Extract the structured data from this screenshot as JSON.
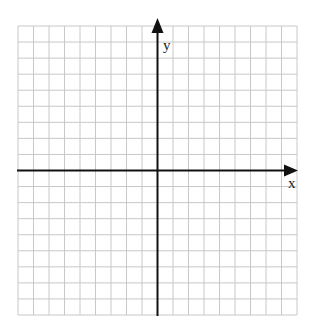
{
  "diagram": {
    "type": "coordinate-plane",
    "grid": {
      "columns": 18,
      "rows": 18,
      "left": 18,
      "top": 26,
      "right": 297,
      "bottom": 315,
      "line_color": "#c8c8c8"
    },
    "axes": {
      "color": "#111111",
      "origin_col": 9,
      "origin_row": 9,
      "x_label": "x",
      "y_label": "y"
    }
  },
  "chart_data": {
    "type": "scatter",
    "title": "",
    "xlabel": "x",
    "ylabel": "y",
    "xlim": [
      -9,
      9
    ],
    "ylim": [
      -9,
      9
    ],
    "grid": true,
    "series": []
  }
}
